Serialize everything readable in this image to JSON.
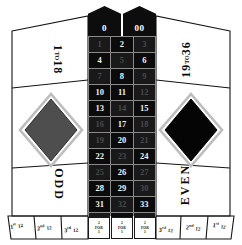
{
  "board": {
    "title": "American Roulette Betting Layout",
    "colors": {
      "red": "#c0392b",
      "black": "#000000",
      "felt": "#ffffff",
      "line": "#111111",
      "text": "#0a0a0a"
    }
  },
  "zeros": [
    {
      "label": "0",
      "name": "zero"
    },
    {
      "label": "00",
      "name": "double-zero"
    }
  ],
  "numbers": [
    {
      "label": "1",
      "color": "red"
    },
    {
      "label": "2",
      "color": "black"
    },
    {
      "label": "3",
      "color": "red"
    },
    {
      "label": "4",
      "color": "black"
    },
    {
      "label": "5",
      "color": "red"
    },
    {
      "label": "6",
      "color": "black"
    },
    {
      "label": "7",
      "color": "red"
    },
    {
      "label": "8",
      "color": "black"
    },
    {
      "label": "9",
      "color": "red"
    },
    {
      "label": "10",
      "color": "black"
    },
    {
      "label": "11",
      "color": "black"
    },
    {
      "label": "12",
      "color": "red"
    },
    {
      "label": "13",
      "color": "black"
    },
    {
      "label": "14",
      "color": "red"
    },
    {
      "label": "15",
      "color": "black"
    },
    {
      "label": "16",
      "color": "red"
    },
    {
      "label": "17",
      "color": "black"
    },
    {
      "label": "18",
      "color": "red"
    },
    {
      "label": "19",
      "color": "red"
    },
    {
      "label": "20",
      "color": "black"
    },
    {
      "label": "21",
      "color": "red"
    },
    {
      "label": "22",
      "color": "black"
    },
    {
      "label": "23",
      "color": "red"
    },
    {
      "label": "24",
      "color": "black"
    },
    {
      "label": "25",
      "color": "red"
    },
    {
      "label": "26",
      "color": "black"
    },
    {
      "label": "27",
      "color": "red"
    },
    {
      "label": "28",
      "color": "black"
    },
    {
      "label": "29",
      "color": "black"
    },
    {
      "label": "30",
      "color": "red"
    },
    {
      "label": "31",
      "color": "black"
    },
    {
      "label": "32",
      "color": "red"
    },
    {
      "label": "33",
      "color": "black"
    },
    {
      "label": "34",
      "color": "red"
    },
    {
      "label": "35",
      "color": "black"
    },
    {
      "label": "36",
      "color": "red"
    }
  ],
  "column_bets": [
    {
      "top": "2",
      "mid": "FOR",
      "bottom": "1"
    },
    {
      "top": "2",
      "mid": "FOR",
      "bottom": "1"
    },
    {
      "top": "2",
      "mid": "FOR",
      "bottom": "1"
    }
  ],
  "outside": {
    "low": {
      "range_start": "1",
      "to": "TO",
      "range_end": "18"
    },
    "high": {
      "range_start": "19",
      "to": "TO",
      "range_end": "36"
    },
    "odd": "ODD",
    "even": "EVEN",
    "red_diamond": "RED",
    "black_diamond": "BLACK"
  },
  "dozens": {
    "left": [
      {
        "ordinal": "1",
        "suffix": "st",
        "count": "12"
      },
      {
        "ordinal": "2",
        "suffix": "nd",
        "count": "12"
      },
      {
        "ordinal": "3",
        "suffix": "rd",
        "count": "12"
      }
    ],
    "right": [
      {
        "ordinal": "3",
        "suffix": "rd",
        "count": "12"
      },
      {
        "ordinal": "2",
        "suffix": "nd",
        "count": "12"
      },
      {
        "ordinal": "1",
        "suffix": "st",
        "count": "12"
      }
    ]
  }
}
